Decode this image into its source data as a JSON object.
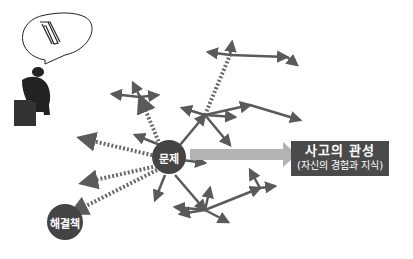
{
  "diagram": {
    "problem_node": {
      "label": "문제"
    },
    "solution_node": {
      "label": "해결책"
    },
    "inertia_box": {
      "title": "사고의 관성",
      "subtitle": "(자신의 경험과 지식)"
    },
    "figure": {
      "name": "thinker-statue",
      "thought": "paperclip"
    },
    "colors": {
      "node": "#444444",
      "arrow": "#5a5a5a",
      "big_arrow": "#b3b3b3",
      "box": "#4a4a4a"
    }
  }
}
